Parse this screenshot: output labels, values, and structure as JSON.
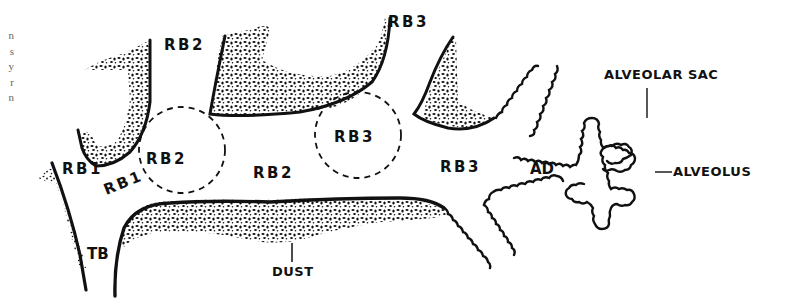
{
  "figure": {
    "edge_text_fragments": [
      "n",
      "s",
      "y",
      "r",
      "n"
    ],
    "labels": {
      "tb": "TB",
      "rb1_a": "RB1",
      "rb1_b": "RB1",
      "rb2_top": "RB2",
      "rb2_circle": "RB2",
      "rb2_mid": "RB2",
      "rb3_top": "RB3",
      "rb3_circle": "RB3",
      "rb3_mid": "RB3",
      "ad": "AD",
      "alveolar_sac": "ALVEOLAR SAC",
      "alveolus": "ALVEOLUS",
      "dust": "DUST"
    },
    "colors": {
      "ink": "#111111",
      "background": "#ffffff"
    }
  }
}
